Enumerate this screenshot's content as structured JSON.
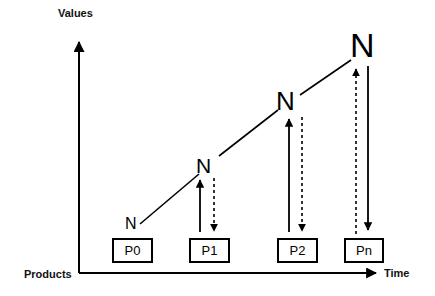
{
  "diagram": {
    "background_color": "#ffffff",
    "stroke_color": "#000000",
    "axes": {
      "y_axis_label": "Values",
      "x_axis_label": "Time",
      "origin_label": "Products",
      "y_axis_x": 79,
      "y_axis_top": 40,
      "x_axis_y": 273,
      "x_axis_right": 378
    },
    "nodes": [
      {
        "letter": "N",
        "size_px": 16,
        "x": 125,
        "y": 216
      },
      {
        "letter": "N",
        "size_px": 21,
        "x": 196,
        "y": 155
      },
      {
        "letter": "N",
        "size_px": 26,
        "x": 276,
        "y": 88
      },
      {
        "letter": "N",
        "size_px": 34,
        "x": 350,
        "y": 28
      }
    ],
    "boxes": [
      {
        "label": "P0",
        "x": 112,
        "y": 238,
        "w": 41,
        "h": 25
      },
      {
        "label": "P1",
        "x": 189,
        "y": 238,
        "w": 41,
        "h": 25
      },
      {
        "label": "P2",
        "x": 277,
        "y": 238,
        "w": 41,
        "h": 25
      },
      {
        "label": "Pn",
        "x": 344,
        "y": 238,
        "w": 40,
        "h": 25
      }
    ],
    "trend_segments": [
      {
        "from_node": 0,
        "to_node": 1,
        "x1": 140,
        "y1": 224,
        "x2": 199,
        "y2": 174,
        "style": "solid"
      },
      {
        "from_node": 1,
        "to_node": 2,
        "x1": 219,
        "y1": 156,
        "x2": 278,
        "y2": 110,
        "style": "solid"
      },
      {
        "from_node": 2,
        "to_node": 3,
        "x1": 300,
        "y1": 95,
        "x2": 351,
        "y2": 60,
        "style": "solid"
      }
    ],
    "vertical_connectors": [
      {
        "product": "P1",
        "up_line": {
          "x": 200,
          "y_top": 177,
          "y_bottom": 232,
          "style": "solid",
          "arrowhead": "up"
        },
        "down_line": {
          "x": 214,
          "y_top": 178,
          "y_bottom": 234,
          "style": "dashed",
          "arrowhead": "down"
        }
      },
      {
        "product": "P2",
        "up_line": {
          "x": 289,
          "y_top": 116,
          "y_bottom": 232,
          "style": "solid",
          "arrowhead": "up"
        },
        "down_line": {
          "x": 302,
          "y_top": 117,
          "y_bottom": 234,
          "style": "dashed",
          "arrowhead": "down"
        }
      },
      {
        "product": "Pn",
        "up_line": {
          "x": 356,
          "y_top": 66,
          "y_bottom": 234,
          "style": "dashed",
          "arrowhead": "up"
        },
        "down_line": {
          "x": 368,
          "y_top": 66,
          "y_bottom": 233,
          "style": "solid",
          "arrowhead": "down"
        }
      }
    ]
  }
}
